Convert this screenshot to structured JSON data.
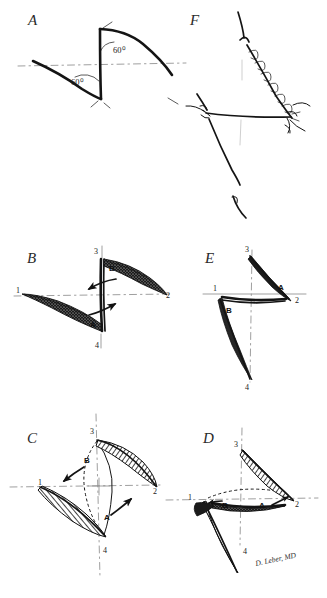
{
  "figure": {
    "signature": "D. Leber, MD",
    "ink_color": "#141414",
    "guide_color": "#8e8e8e",
    "background": "#ffffff"
  },
  "panels": [
    {
      "id": "A",
      "letter": "A",
      "caption": "Z-plasty design with 60 degree limbs",
      "angles": [
        "60⁰",
        "60⁰"
      ]
    },
    {
      "id": "B",
      "letter": "B",
      "caption": "Flaps incised, transposition direction shown",
      "vertices": [
        "1",
        "2",
        "3",
        "4"
      ],
      "flaps": [
        "A",
        "B"
      ]
    },
    {
      "id": "C",
      "letter": "C",
      "caption": "Flaps elevated over the common limb",
      "vertices": [
        "1",
        "2",
        "3",
        "4"
      ],
      "flaps": [
        "A",
        "B"
      ]
    },
    {
      "id": "D",
      "letter": "D",
      "caption": "Flaps crossing into transposed position",
      "vertices": [
        "1",
        "2",
        "3",
        "4"
      ],
      "flaps": [
        "A",
        "B"
      ]
    },
    {
      "id": "E",
      "letter": "E",
      "caption": "Completed transposition, common limb reoriented",
      "vertices": [
        "1",
        "2",
        "3",
        "4"
      ],
      "flaps": [
        "A",
        "B"
      ]
    },
    {
      "id": "F",
      "letter": "F",
      "caption": "Sutured Z-plasty in situ with lengthened scar"
    }
  ],
  "labels": {
    "angle_60": "60⁰",
    "v1": "1",
    "v2": "2",
    "v3": "3",
    "v4": "4",
    "flap_a": "A",
    "flap_b": "B"
  }
}
